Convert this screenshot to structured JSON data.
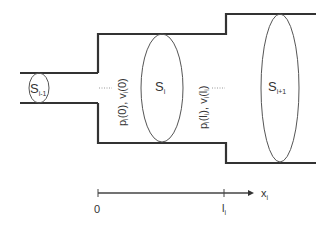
{
  "diagram": {
    "sections": [
      {
        "id": "prev",
        "label_main": "S",
        "label_sub": "i-1"
      },
      {
        "id": "current",
        "label_main": "S",
        "label_sub": "i"
      },
      {
        "id": "next",
        "label_main": "S",
        "label_sub": "i+1"
      }
    ],
    "boundary_labels": {
      "start": {
        "p": "p",
        "p_sub": "i",
        "p_arg": "(0), ",
        "v": "v",
        "v_sub": "i",
        "v_arg": "(0)"
      },
      "end": {
        "p": "p",
        "p_sub": "i",
        "p_arg_open": "(l",
        "p_arg_sub": "i",
        "p_arg_close": "), ",
        "v": "v",
        "v_sub": "i",
        "v_arg_open": "(l",
        "v_arg_sub": "i",
        "v_arg_close": ")"
      }
    },
    "axis": {
      "origin_label": "0",
      "end_label_main": "l",
      "end_label_sub": "i",
      "var_main": "x",
      "var_sub": "i"
    },
    "colors": {
      "wall": "#333333",
      "ellipse": "#555555",
      "text": "#333333"
    }
  }
}
